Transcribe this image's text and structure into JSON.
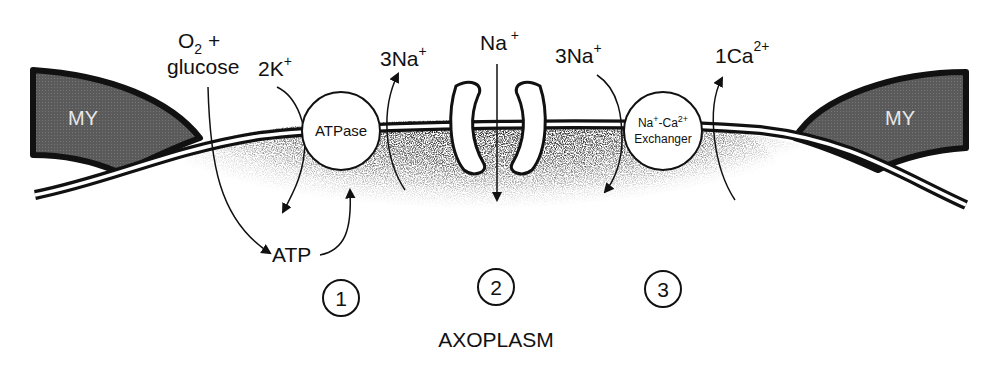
{
  "diagram": {
    "type": "membrane-transport-schematic",
    "compartments": {
      "myelin_left": "MY",
      "myelin_right": "MY",
      "interior": "AXOPLASM"
    },
    "inputs": {
      "o2": "O",
      "o2_sub": "2",
      "o2_plus": " +",
      "glucose": "glucose"
    },
    "pump": {
      "label": "ATPase",
      "in_ion": "2K",
      "in_ion_sup": "+",
      "out_ion": "3Na",
      "out_ion_sup": "+",
      "energy": "ATP"
    },
    "channel": {
      "ion": "Na",
      "ion_sup": "+"
    },
    "exchanger": {
      "label_line1_a": "Na",
      "label_line1_sup1": "+",
      "label_line1_b": "-Ca",
      "label_line1_sup2": "2+",
      "label_line2": "Exchanger",
      "in_ion": "3Na",
      "in_ion_sup": "+",
      "out_ion": "1Ca",
      "out_ion_sup": "2+"
    },
    "markers": [
      "1",
      "2",
      "3"
    ],
    "colors": {
      "ink": "#111111",
      "myelin_fill": "#555555",
      "background": "#ffffff"
    }
  }
}
